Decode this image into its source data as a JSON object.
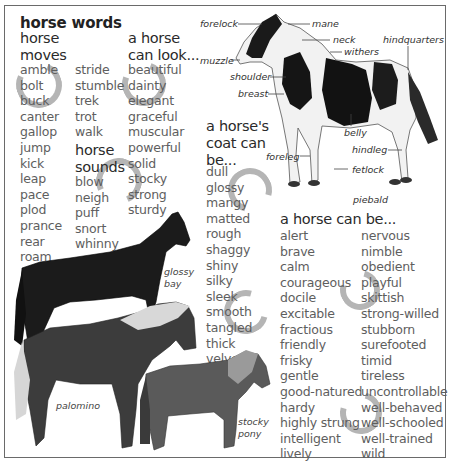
{
  "title": "horse words",
  "sections": {
    "moves": {
      "heading_line1": "horse",
      "heading_line2": "moves",
      "col1": [
        "amble",
        "bolt",
        "buck",
        "canter",
        "gallop",
        "jump",
        "kick",
        "leap",
        "pace",
        "plod",
        "prance",
        "rear",
        "roam"
      ],
      "col2": [
        "stride",
        "stumble",
        "trek",
        "trot",
        "walk"
      ]
    },
    "sounds": {
      "heading_line1": "horse",
      "heading_line2": "sounds",
      "items": [
        "blow",
        "neigh",
        "puff",
        "snort",
        "whinny"
      ]
    },
    "look": {
      "heading_line1": "a horse",
      "heading_line2": "can look...",
      "items": [
        "beautiful",
        "dainty",
        "elegant",
        "graceful",
        "muscular",
        "powerful",
        "solid",
        "stocky",
        "strong",
        "sturdy"
      ]
    },
    "coat": {
      "heading_line1": "a horse's",
      "heading_line2": "coat can",
      "heading_line3": "be...",
      "items": [
        "dull",
        "glossy",
        "mangy",
        "matted",
        "rough",
        "shaggy",
        "shiny",
        "silky",
        "sleek",
        "smooth",
        "tangled",
        "thick",
        "velvety"
      ]
    },
    "can_be": {
      "heading": "a horse can be...",
      "col1": [
        "alert",
        "brave",
        "calm",
        "courageous",
        "docile",
        "excitable",
        "fractious",
        "friendly",
        "frisky",
        "gentle",
        "good-natured",
        "hardy",
        "highly strung",
        "intelligent",
        "lively"
      ],
      "col2": [
        "nervous",
        "nimble",
        "obedient",
        "playful",
        "skittish",
        "strong-willed",
        "stubborn",
        "surefooted",
        "timid",
        "tireless",
        "uncontrollable",
        "well-behaved",
        "well-schooled",
        "well-trained",
        "wild"
      ]
    }
  },
  "anatomy_labels": {
    "forelock": "forelock",
    "mane": "mane",
    "neck": "neck",
    "withers": "withers",
    "hindquarters": "hindquarters",
    "muzzle": "muzzle",
    "shoulder": "shoulder",
    "breast": "breast",
    "belly": "belly",
    "hindleg": "hindleg",
    "foreleg": "foreleg",
    "fetlock": "fetlock"
  },
  "captions": {
    "piebald": "piebald",
    "glossy_bay_1": "glossy",
    "glossy_bay_2": "bay",
    "palomino": "palomino",
    "stocky_pony_1": "stocky",
    "stocky_pony_2": "pony"
  },
  "colors": {
    "frame": "#6a6a6a",
    "heading": "#2a2a2a",
    "list_text": "#5e5e5e",
    "horseshoe": "#8a8a8a"
  }
}
